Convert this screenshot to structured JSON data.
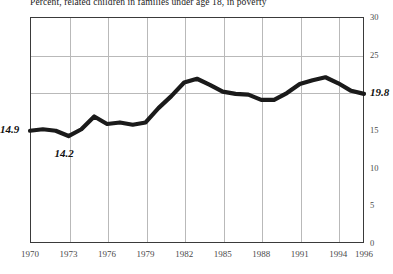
{
  "chart_data": {
    "type": "line",
    "title": "Percent, related children in families under age 18, in poverty",
    "xlabel": "",
    "ylabel": "",
    "xlim": [
      1970,
      1996
    ],
    "ylim": [
      0,
      30
    ],
    "grid": true,
    "legend": "none",
    "x": [
      1970,
      1971,
      1972,
      1973,
      1974,
      1975,
      1976,
      1977,
      1978,
      1979,
      1980,
      1981,
      1982,
      1983,
      1984,
      1985,
      1986,
      1987,
      1988,
      1989,
      1990,
      1991,
      1992,
      1993,
      1994,
      1995,
      1996
    ],
    "values": [
      14.9,
      15.1,
      14.9,
      14.2,
      15.1,
      16.8,
      15.8,
      16.0,
      15.7,
      16.0,
      17.9,
      19.5,
      21.3,
      21.8,
      21.0,
      20.1,
      19.8,
      19.7,
      19.0,
      19.0,
      19.9,
      21.1,
      21.6,
      22.0,
      21.2,
      20.2,
      19.8
    ],
    "point_labels": [
      {
        "year": 1970,
        "value": 14.9,
        "text": "14.9"
      },
      {
        "year": 1973,
        "value": 14.2,
        "text": "14.2"
      },
      {
        "year": 1996,
        "value": 19.8,
        "text": "19.8"
      }
    ],
    "yticks": [
      {
        "value": 0,
        "label": "0"
      },
      {
        "value": 5,
        "label": "5"
      },
      {
        "value": 10,
        "label": "10"
      },
      {
        "value": 15,
        "label": "15"
      },
      {
        "value": 25,
        "label": "25"
      },
      {
        "value": 30,
        "label": "30"
      }
    ],
    "ygridlines": [
      20,
      25
    ],
    "xticks": [
      {
        "value": 1970,
        "label": "1970"
      },
      {
        "value": 1973,
        "label": "1973"
      },
      {
        "value": 1976,
        "label": "1976"
      },
      {
        "value": 1979,
        "label": "1979"
      },
      {
        "value": 1982,
        "label": "1982"
      },
      {
        "value": 1985,
        "label": "1985"
      },
      {
        "value": 1988,
        "label": "1988"
      },
      {
        "value": 1991,
        "label": "1991"
      },
      {
        "value": 1994,
        "label": "1994"
      },
      {
        "value": 1996,
        "label": "1996"
      }
    ],
    "xgridlines": [
      1973,
      1976,
      1979,
      1982,
      1985,
      1988,
      1991,
      1994
    ],
    "colors": {
      "line": "#1a1a1a",
      "grid": "#b9b9b9",
      "axis": "#3a3a3a",
      "text": "#4a4a4a",
      "annotation": "#111111",
      "background": "#ffffff"
    }
  }
}
